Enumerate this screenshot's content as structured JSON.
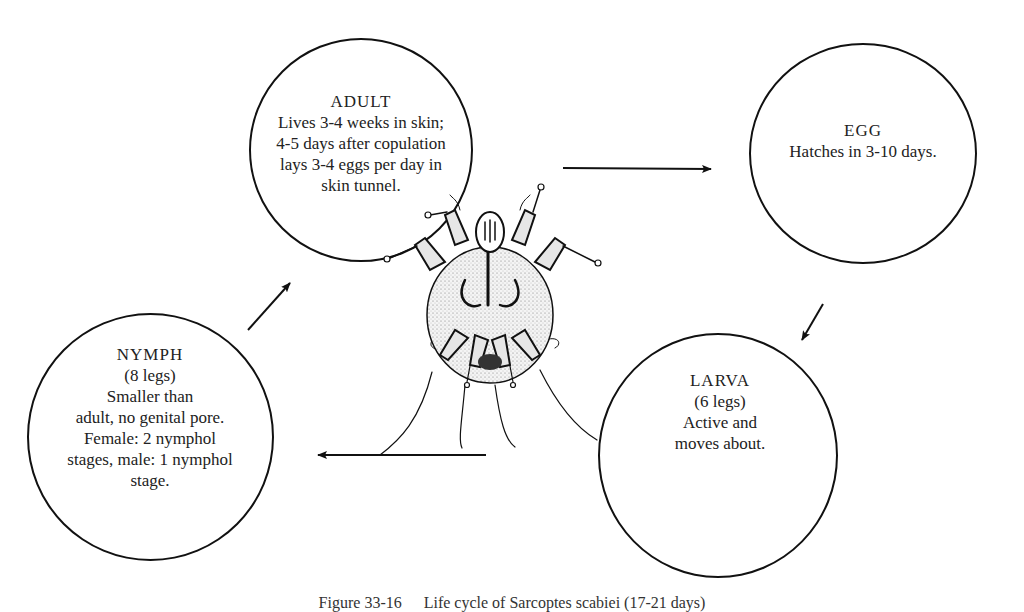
{
  "diagram": {
    "type": "life-cycle",
    "stages": [
      {
        "id": "adult",
        "title": "ADULT",
        "lines": [
          "Lives 3-4 weeks in skin;",
          "4-5 days after copulation",
          "lays 3-4 eggs per day in",
          "skin tunnel."
        ]
      },
      {
        "id": "egg",
        "title": "EGG",
        "lines": [
          "Hatches in 3-10 days."
        ]
      },
      {
        "id": "larva",
        "title": "LARVA",
        "lines": [
          "(6 legs)",
          "Active and",
          "moves about."
        ]
      },
      {
        "id": "nymph",
        "title": "NYMPH",
        "lines": [
          "(8 legs)",
          "Smaller than",
          "adult, no genital pore.",
          "Female: 2 nymphol",
          "stages, male: 1 nymphol",
          "stage."
        ]
      }
    ],
    "flow": [
      "adult → egg",
      "egg → larva",
      "larva → nymph",
      "nymph → adult"
    ],
    "center_illustration": "scabies-mite-drawing"
  },
  "caption": {
    "figure": "Figure 33-16",
    "text": "Life cycle of Sarcoptes scabiei (17-21 days)"
  }
}
